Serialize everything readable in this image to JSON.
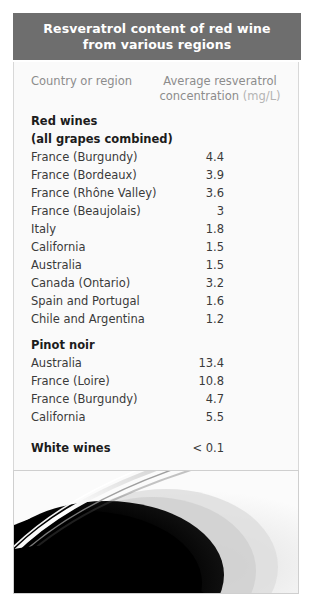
{
  "title": {
    "line1": "Resveratrol content of red wine",
    "line2": "from various regions"
  },
  "columns": {
    "country": "Country or region",
    "concentration_line1": "Average resveratrol",
    "concentration_line2": "concentration",
    "unit": "(mg/L)"
  },
  "rows": [
    {
      "label": "Red wines",
      "value": "",
      "kind": "section"
    },
    {
      "label": "(all grapes combined)",
      "value": "",
      "kind": "section"
    },
    {
      "label": "France (Burgundy)",
      "value": "4.4",
      "kind": "data"
    },
    {
      "label": "France (Bordeaux)",
      "value": "3.9",
      "kind": "data"
    },
    {
      "label": "France (Rhône Valley)",
      "value": "3.6",
      "kind": "data"
    },
    {
      "label": "France (Beaujolais)",
      "value": "3",
      "kind": "data"
    },
    {
      "label": "Italy",
      "value": "1.8",
      "kind": "data"
    },
    {
      "label": "California",
      "value": "1.5",
      "kind": "data"
    },
    {
      "label": "Australia",
      "value": "1.5",
      "kind": "data"
    },
    {
      "label": "Canada (Ontario)",
      "value": "3.2",
      "kind": "data"
    },
    {
      "label": "Spain and Portugal",
      "value": "1.6",
      "kind": "data"
    },
    {
      "label": "Chile and Argentina",
      "value": "1.2",
      "kind": "data"
    },
    {
      "label": "Pinot noir",
      "value": "",
      "kind": "section-gap"
    },
    {
      "label": "Australia",
      "value": "13.4",
      "kind": "data"
    },
    {
      "label": "France (Loire)",
      "value": "10.8",
      "kind": "data"
    },
    {
      "label": "France (Burgundy)",
      "value": "4.7",
      "kind": "data"
    },
    {
      "label": "California",
      "value": "5.5",
      "kind": "data"
    },
    {
      "label": "White wines",
      "value": "< 0.1",
      "kind": "bold-gap"
    },
    {
      "label": "Port and sherry",
      "value": "< 0.1",
      "kind": "bold-gap"
    }
  ],
  "photo": {
    "caption_alt": "Close-up photograph of a glass of red wine showing the glass rim and dark wine surface",
    "colors": {
      "wine_dark": "#070707",
      "glass_highlight": "#ffffff",
      "background_light": "#f2f2f2"
    }
  },
  "colors": {
    "title_bar": "#6e6e6e",
    "title_text": "#ffffff",
    "card_background": "#fafafa",
    "column_header_text": "#8c8c8c",
    "unit_text": "#b4b4b4",
    "row_text": "#3a3a3a",
    "section_text": "#1c1c1c"
  }
}
